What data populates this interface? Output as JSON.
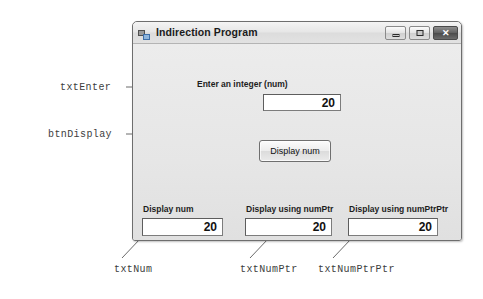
{
  "window": {
    "title": "Indirection Program",
    "icon": "app-window-icon",
    "controls": {
      "minimize": "minimize-icon",
      "maximize": "maximize-icon",
      "close": "close-icon",
      "close_glyph": "✕"
    }
  },
  "form": {
    "enter_label": "Enter an integer (num)",
    "enter_value": "20",
    "enter_placeholder": "",
    "button_label": "Display num",
    "outputs": [
      {
        "label": "Display num",
        "value": "20"
      },
      {
        "label": "Display using numPtr",
        "value": "20"
      },
      {
        "label": "Display using numPtrPtr",
        "value": "20"
      }
    ]
  },
  "annotations": [
    {
      "name": "txtEnter",
      "text": "txtEnter"
    },
    {
      "name": "btnDisplay",
      "text": "btnDisplay"
    },
    {
      "name": "txtNum",
      "text": "txtNum"
    },
    {
      "name": "txtNumPtr",
      "text": "txtNumPtr"
    },
    {
      "name": "txtNumPtrPtr",
      "text": "txtNumPtrPtr"
    }
  ],
  "colors": {
    "page_background": "#ffffff",
    "window_client": "#e8e8e8",
    "title_bar": "#e6e6e6",
    "textbox_background": "#ffffff",
    "annotation_text": "#3d3d3d",
    "leader_line": "#6b6b6b"
  }
}
